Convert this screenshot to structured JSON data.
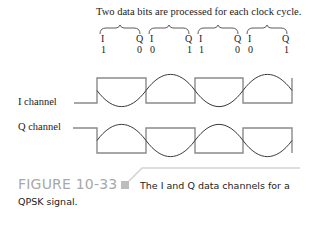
{
  "figure": {
    "title": "Two data bits are processed for each clock cycle.",
    "bit_pairs": [
      {
        "i_label": "I",
        "q_label": "Q",
        "i_bit": "1",
        "q_bit": "0"
      },
      {
        "i_label": "I",
        "q_label": "Q",
        "i_bit": "0",
        "q_bit": "1"
      },
      {
        "i_label": "I",
        "q_label": "Q",
        "i_bit": "1",
        "q_bit": "0"
      },
      {
        "i_label": "I",
        "q_label": "Q",
        "i_bit": "0",
        "q_bit": "1"
      }
    ],
    "channels": [
      {
        "label": "I channel",
        "data": [
          1,
          0,
          1,
          0
        ]
      },
      {
        "label": "Q channel",
        "data": [
          0,
          1,
          0,
          1
        ]
      }
    ],
    "caption": {
      "number": "FIGURE 10-33",
      "text_line1": "The I and Q data channels for a",
      "text_line2": "QPSK signal."
    },
    "colors": {
      "waveform": "#8a8a8a",
      "sine": "#3a3a3a",
      "figure_number": "#a8a8a8",
      "accent_square": "#bdbdbd"
    }
  }
}
